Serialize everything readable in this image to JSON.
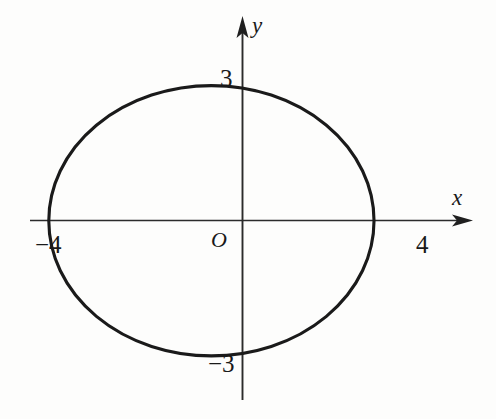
{
  "figure": {
    "background_color": "#fdfdfc",
    "stroke_color": "#1a1a1a",
    "axis_color": "#2b2b2b",
    "width": 496,
    "height": 419
  },
  "axes": {
    "x_axis_label": "x",
    "y_axis_label": "y",
    "origin_label": "O"
  },
  "ticks": {
    "y_positive": "3",
    "y_negative": "−3",
    "x_positive": "4",
    "x_negative": "−4"
  },
  "chart_data": {
    "type": "line",
    "title": "",
    "subtitle": "",
    "xlabel": "x",
    "ylabel": "y",
    "curve": "ellipse",
    "equation": "x^2/16 + y^2/9 = 1",
    "center": [
      0,
      0
    ],
    "semi_axis_x": 4,
    "semi_axis_y": 3,
    "vertices": [
      [
        -4,
        0
      ],
      [
        4,
        0
      ]
    ],
    "co_vertices": [
      [
        0,
        3
      ],
      [
        0,
        -3
      ]
    ],
    "x_tick_labels": [
      "−4",
      "4"
    ],
    "x_tick_values": [
      -4,
      4
    ],
    "y_tick_labels": [
      "−3",
      "3"
    ],
    "y_tick_values": [
      -3,
      3
    ],
    "xlim": [
      -5.2,
      7.0
    ],
    "ylim": [
      -4.4,
      4.9
    ],
    "grid": false,
    "legend": "none",
    "annotations": [
      {
        "text": "O",
        "x": -0.6,
        "y": -0.55,
        "role": "origin"
      },
      {
        "text": "y",
        "x": 0.35,
        "y": 4.8,
        "role": "axis-name"
      },
      {
        "text": "x",
        "x": 5.4,
        "y": 0.9,
        "role": "axis-name"
      }
    ]
  }
}
